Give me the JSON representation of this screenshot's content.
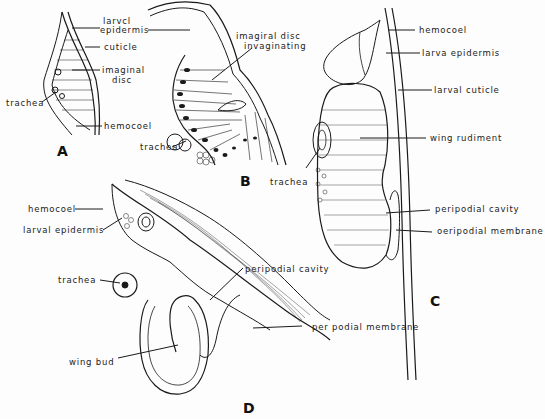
{
  "figure": {
    "panels": [
      {
        "id": "A",
        "letter": "A",
        "labels": {
          "larval_epidermis_1": "larvcl",
          "larval_epidermis_2": "epidermis",
          "cuticle": "cuticle",
          "imaginal_disc_1": "imaginal",
          "imaginal_disc_2": "disc",
          "trachea": "trachea",
          "hemocoel": "hemocoel"
        }
      },
      {
        "id": "B",
        "letter": "B",
        "labels": {
          "imaginal_disc_invaginating_1": "imagiral  disc",
          "imaginal_disc_invaginating_2": "invaginating",
          "trachea": "trachea"
        }
      },
      {
        "id": "C",
        "letter": "C",
        "labels": {
          "hemocoel": "hemocoel",
          "larva_epidermis": "larva  epidermis",
          "larval_cuticle": "larval  cuticle",
          "wing_rudiment": "wing  rudiment",
          "trachea": "trachea",
          "peripodial_cavity": "peripodial  cavity",
          "peripodial_membrane": "oeripodial  membrane"
        }
      },
      {
        "id": "D",
        "letter": "D",
        "labels": {
          "hemocoel": "hemocoel",
          "larval_epidermis": "larval  epidermis",
          "trachea": "trachea",
          "wing_bud": "wing  bud",
          "peripodial_cavity": "peripodial  cavity",
          "peripodial_membrane": "per podial  membrane"
        }
      }
    ],
    "colors": {
      "ink": "#1a1a1a",
      "background": "#fdfdfd"
    }
  }
}
